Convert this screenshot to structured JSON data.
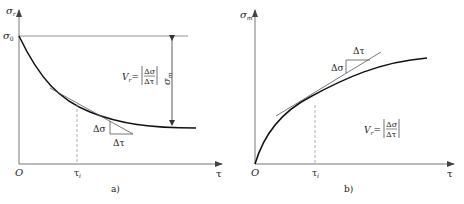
{
  "panel_a": {
    "caption": "a)",
    "y_axis_label": "σ",
    "y_axis_sub": "r",
    "x_axis_label": "τ",
    "origin": "O",
    "initial_value_label": "σ",
    "initial_value_sub": "0",
    "tick_label": "τ",
    "tick_sub": "i",
    "amplitude_label": "σ",
    "amplitude_sub": "m",
    "delta_sigma": "Δσ",
    "delta_tau": "Δτ",
    "formula_lhs": "V",
    "formula_lhs_sub": "r",
    "formula_eq": "=",
    "formula_num": "Δσ",
    "formula_den": "Δτ"
  },
  "panel_b": {
    "caption": "b)",
    "y_axis_label": "σ",
    "y_axis_sub": "m",
    "x_axis_label": "τ",
    "origin": "O",
    "tick_label": "τ",
    "tick_sub": "i",
    "delta_sigma": "Δσ",
    "delta_tau": "Δτ",
    "formula_lhs": "V",
    "formula_lhs_sub": "r",
    "formula_eq": "=",
    "formula_num": "Δσ",
    "formula_den": "Δτ"
  },
  "colors": {
    "curve": "#111111",
    "axis": "#555555",
    "guide": "#888888",
    "text": "#222222"
  }
}
